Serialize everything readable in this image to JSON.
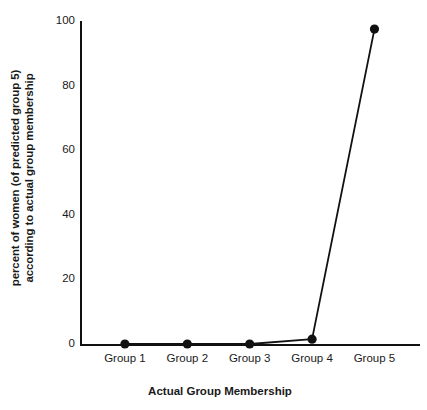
{
  "chart_data": {
    "type": "line",
    "title": "",
    "subtitle": "",
    "xlabel": "Actual Group Membership",
    "ylabel_line1": "percent of women (of predicted group 5)",
    "ylabel_line2": "according to actual group membership",
    "categories": [
      "Group 1",
      "Group 2",
      "Group 3",
      "Group 4",
      "Group 5"
    ],
    "series": [
      {
        "name": "percent of predicted group 5",
        "values": [
          0,
          0,
          0,
          1.5,
          97.5
        ]
      }
    ],
    "ylim": [
      0,
      100
    ],
    "yticks": [
      0,
      20,
      40,
      60,
      80,
      100
    ],
    "ytick_labels": [
      "0",
      "20",
      "40",
      "60",
      "80",
      "100"
    ],
    "grid": false,
    "legend": false,
    "legend_position": "none",
    "marker": "filled-circle",
    "marker_color": "#111111",
    "line_color": "#111111",
    "background_color": "#ffffff",
    "annotations": []
  }
}
